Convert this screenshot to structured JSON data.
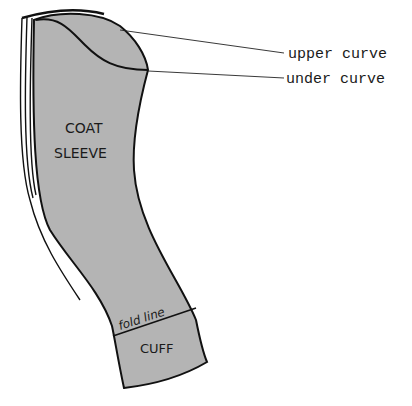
{
  "diagram": {
    "colors": {
      "fill": "#b4b4b4",
      "outline": "#111111",
      "background": "#ffffff"
    },
    "piece_labels": {
      "line1": "COAT",
      "line2": "SLEEVE",
      "fold_line": "fold line",
      "cuff": "CUFF"
    },
    "callouts": [
      {
        "id": "upper-curve",
        "label": "upper curve"
      },
      {
        "id": "under-curve",
        "label": "under curve"
      }
    ]
  }
}
